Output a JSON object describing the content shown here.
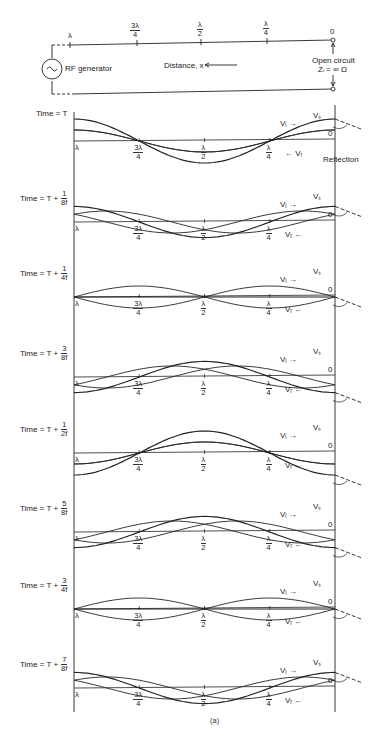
{
  "circuit": {
    "generator_label": "RF generator",
    "distance_label": "Distance, x",
    "open_circuit_label": "Open circuit",
    "load_label": "Zₗ = ∞ Ω",
    "positions": [
      {
        "label": "λ",
        "num": "",
        "den": ""
      },
      {
        "label": "",
        "num": "3λ",
        "den": "4"
      },
      {
        "label": "",
        "num": "λ",
        "den": "2"
      },
      {
        "label": "",
        "num": "λ",
        "den": "4"
      },
      {
        "label": "0",
        "num": "",
        "den": ""
      }
    ]
  },
  "panels": [
    {
      "time_prefix": "Time = T",
      "num": "",
      "den": "",
      "labels": {
        "vs": "Vₛ",
        "vi": "Vᵢ →",
        "vr": "← Vᵣ",
        "reflection": "Reflection"
      }
    },
    {
      "time_prefix": "Time = T +",
      "num": "1",
      "den": "8f",
      "labels": {
        "vs": "Vₛ",
        "vi": "Vᵢ →",
        "vr": "Vᵣ ←"
      }
    },
    {
      "time_prefix": "Time = T +",
      "num": "1",
      "den": "4f",
      "labels": {
        "vs": "Vₛ",
        "vi": "Vᵢ →",
        "vr": "Vᵣ ←"
      }
    },
    {
      "time_prefix": "Time = T +",
      "num": "3",
      "den": "8f",
      "labels": {
        "vs": "Vₛ",
        "vi": "Vᵢ →",
        "vr": "Vᵣ ←"
      }
    },
    {
      "time_prefix": "Time = T +",
      "num": "1",
      "den": "2f",
      "labels": {
        "vs": "Vₛ",
        "vi": "Vᵢ →",
        "vr": "Vᵣ ←"
      }
    },
    {
      "time_prefix": "Time = T +",
      "num": "5",
      "den": "8f",
      "labels": {
        "vs": "Vₛ",
        "vi": "Vᵢ →",
        "vr": "Vᵣ ←"
      }
    },
    {
      "time_prefix": "Time = T +",
      "num": "3",
      "den": "4f",
      "labels": {
        "vs": "Vₛ",
        "vi": "Vᵢ →",
        "vr": "Vᵣ ←"
      }
    },
    {
      "time_prefix": "Time = T +",
      "num": "7",
      "den": "8f",
      "labels": {
        "vs": "Vₛ",
        "vi": "Vᵢ →",
        "vr": "Vᵣ ←"
      }
    }
  ],
  "axis_labels": {
    "lambda": "λ",
    "three_quarter": {
      "num": "3λ",
      "den": "4"
    },
    "half": {
      "num": "λ",
      "den": "2"
    },
    "quarter": {
      "num": "λ",
      "den": "4"
    },
    "zero": "0"
  },
  "caption": "(a)",
  "colors": {
    "ink": "#222222",
    "background": "#ffffff"
  }
}
